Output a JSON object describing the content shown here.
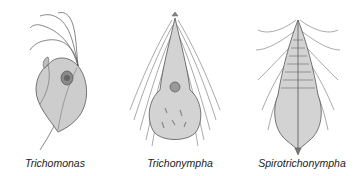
{
  "figure": {
    "organisms": [
      {
        "name": "Trichomonas"
      },
      {
        "name": "Trichonympha"
      },
      {
        "name": "Spirotrichonympha"
      }
    ]
  },
  "colors": {
    "body_fill": "#c9c9c9",
    "outline": "#555555",
    "flagella": "#444444",
    "background": "#ffffff"
  }
}
